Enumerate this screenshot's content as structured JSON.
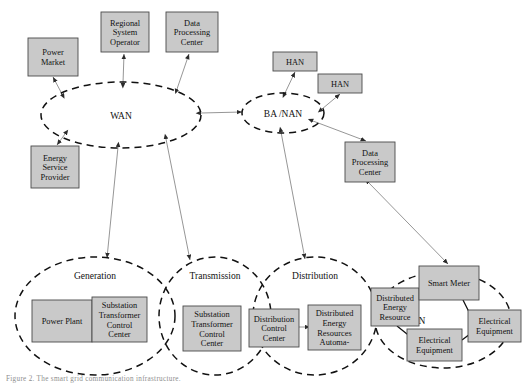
{
  "figure": {
    "caption": "Figure 2.   The smart grid communication infrastructure.",
    "box_fill": "#c9c9c9",
    "box_stroke": "#4a4a4a",
    "line_color": "#8a8a8a",
    "ellipse_stroke": "#111111"
  },
  "clouds": [
    {
      "id": "wan",
      "label": "WAN",
      "cx": 121,
      "cy": 115,
      "rx": 80,
      "ry": 33
    },
    {
      "id": "banan",
      "label": "BA /NAN",
      "cx": 283,
      "cy": 113,
      "rx": 41,
      "ry": 20
    },
    {
      "id": "gen",
      "label": "Generation",
      "cx": 95,
      "cy": 316,
      "rx": 80,
      "ry": 59
    },
    {
      "id": "trans",
      "label": "Transmission",
      "cx": 215,
      "cy": 316,
      "rx": 56,
      "ry": 59
    },
    {
      "id": "dist",
      "label": "Distribution",
      "cx": 315,
      "cy": 316,
      "rx": 62,
      "ry": 59
    },
    {
      "id": "han",
      "label": "HAN",
      "cx": 443,
      "cy": 320,
      "rx": 68,
      "ry": 48
    }
  ],
  "boxes": [
    {
      "id": "power-market",
      "lines": [
        "Power",
        "Market"
      ],
      "x": 28,
      "y": 38,
      "w": 50,
      "h": 38
    },
    {
      "id": "regional-system-operator",
      "lines": [
        "Regional",
        "System",
        "Operator"
      ],
      "x": 101,
      "y": 12,
      "w": 48,
      "h": 40
    },
    {
      "id": "data-processing-center-top",
      "lines": [
        "Data",
        "Processing",
        "Center"
      ],
      "x": 166,
      "y": 12,
      "w": 52,
      "h": 40
    },
    {
      "id": "energy-service-provider",
      "lines": [
        "Energy",
        "Service",
        "Provider"
      ],
      "x": 31,
      "y": 146,
      "w": 48,
      "h": 42
    },
    {
      "id": "han-box-1",
      "lines": [
        "HAN"
      ],
      "x": 273,
      "y": 52,
      "w": 44,
      "h": 19
    },
    {
      "id": "han-box-2",
      "lines": [
        "HAN"
      ],
      "x": 318,
      "y": 74,
      "w": 44,
      "h": 19
    },
    {
      "id": "data-processing-center-right",
      "lines": [
        "Data",
        "Processing",
        "Center"
      ],
      "x": 345,
      "y": 142,
      "w": 50,
      "h": 40
    },
    {
      "id": "power-plant",
      "lines": [
        "Power Plant"
      ],
      "x": 32,
      "y": 300,
      "w": 60,
      "h": 42
    },
    {
      "id": "substation-transformer-control-center-gen",
      "lines": [
        "Substation",
        "Transformer",
        "Control",
        "Center"
      ],
      "x": 92,
      "y": 297,
      "w": 55,
      "h": 45
    },
    {
      "id": "substation-transformer-control-center-trans",
      "lines": [
        "Substation",
        "Transformer",
        "Control",
        "Center"
      ],
      "x": 183,
      "y": 306,
      "w": 58,
      "h": 45
    },
    {
      "id": "distribution-control-center",
      "lines": [
        "Distribution",
        "Control",
        "Center"
      ],
      "x": 249,
      "y": 309,
      "w": 50,
      "h": 38
    },
    {
      "id": "distributed-energy-resources-automation",
      "lines": [
        "Distributed",
        "Energy",
        "Resources",
        "Automa-"
      ],
      "x": 308,
      "y": 305,
      "w": 53,
      "h": 45
    },
    {
      "id": "distributed-energy-resource",
      "lines": [
        "Distributed",
        "Energy",
        "Resource"
      ],
      "x": 371,
      "y": 288,
      "w": 48,
      "h": 38
    },
    {
      "id": "smart-meter",
      "lines": [
        "Smart Meter"
      ],
      "x": 419,
      "y": 266,
      "w": 60,
      "h": 34
    },
    {
      "id": "electrical-equipment-1",
      "lines": [
        "Electrical",
        "Equipment"
      ],
      "x": 407,
      "y": 329,
      "w": 55,
      "h": 32
    },
    {
      "id": "electrical-equipment-2",
      "lines": [
        "Electrical",
        "Equipment"
      ],
      "x": 468,
      "y": 310,
      "w": 53,
      "h": 32
    }
  ],
  "edges": [
    {
      "id": "wan-power-market",
      "x1": 62,
      "y1": 94,
      "x2": 53,
      "y2": 77,
      "arrow": "both"
    },
    {
      "id": "wan-regional-system-operator",
      "x1": 123,
      "y1": 83,
      "x2": 124,
      "y2": 54,
      "arrow": "both"
    },
    {
      "id": "wan-data-processing-center",
      "x1": 177,
      "y1": 89,
      "x2": 189,
      "y2": 54,
      "arrow": "both"
    },
    {
      "id": "wan-energy-service-provider",
      "x1": 65,
      "y1": 134,
      "x2": 57,
      "y2": 145,
      "arrow": "both"
    },
    {
      "id": "wan-banan",
      "x1": 201,
      "y1": 113,
      "x2": 242,
      "y2": 112,
      "arrow": "both"
    },
    {
      "id": "banan-han-1",
      "x1": 285,
      "y1": 93,
      "x2": 295,
      "y2": 72,
      "arrow": "both"
    },
    {
      "id": "banan-han-2",
      "x1": 322,
      "y1": 109,
      "x2": 340,
      "y2": 94,
      "arrow": "both"
    },
    {
      "id": "banan-data-processing-center",
      "x1": 313,
      "y1": 121,
      "x2": 366,
      "y2": 141,
      "arrow": "both"
    },
    {
      "id": "wan-generation",
      "x1": 118,
      "y1": 147,
      "x2": 107,
      "y2": 258,
      "arrow": "both"
    },
    {
      "id": "wan-transmission",
      "x1": 166,
      "y1": 139,
      "x2": 190,
      "y2": 260,
      "arrow": "both"
    },
    {
      "id": "banan-distribution",
      "x1": 281,
      "y1": 132,
      "x2": 305,
      "y2": 259,
      "arrow": "both"
    },
    {
      "id": "dpc-smart-meter",
      "x1": 369,
      "y1": 183,
      "x2": 448,
      "y2": 264,
      "arrow": "both"
    },
    {
      "id": "power-plant-substation",
      "x1": 92,
      "y1": 321,
      "x2": 104,
      "y2": 321,
      "arrow": "both"
    },
    {
      "id": "dcc-dera",
      "x1": 299,
      "y1": 327,
      "x2": 310,
      "y2": 327,
      "arrow": "both"
    }
  ],
  "han_links": [
    {
      "id": "der-smart-meter",
      "d": "M 419 296 L 438 285 L 444 284"
    },
    {
      "id": "smart-meter-ee2",
      "d": "M 463 300 L 471 316 L 476 322"
    },
    {
      "id": "der-ee1",
      "d": "M 397 326 L 412 338 L 418 341"
    },
    {
      "id": "ee1-ee2",
      "d": "M 462 340 L 470 334 L 474 330"
    }
  ]
}
